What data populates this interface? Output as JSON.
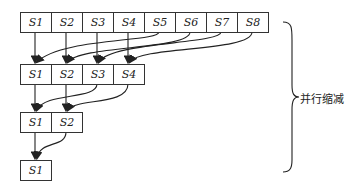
{
  "diagram": {
    "rows": [
      {
        "cells": [
          "S1",
          "S2",
          "S3",
          "S4",
          "S5",
          "S6",
          "S7",
          "S8"
        ]
      },
      {
        "cells": [
          "S1",
          "S2",
          "S3",
          "S4"
        ]
      },
      {
        "cells": [
          "S1",
          "S2"
        ]
      },
      {
        "cells": [
          "S1"
        ]
      }
    ],
    "brace_label": "并行缩减"
  }
}
